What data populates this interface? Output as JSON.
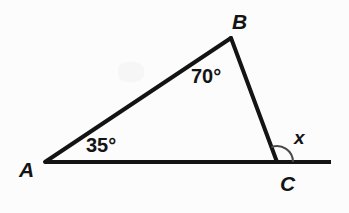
{
  "figure": {
    "background_color": "#fcfcfc",
    "stroke_color": "#141414",
    "arc_color": "#4a4a4a"
  },
  "vertices": {
    "A": {
      "label": "A",
      "x": 45,
      "y": 162
    },
    "B": {
      "label": "B",
      "x": 231,
      "y": 38
    },
    "C": {
      "label": "C",
      "x": 277,
      "y": 162
    }
  },
  "baseline": {
    "start_x": 45,
    "end_x": 331,
    "y": 162
  },
  "angles": {
    "at_A": {
      "label": "35°",
      "value": 35
    },
    "at_B": {
      "label": "70°",
      "value": 70
    },
    "exterior_at_C": {
      "label": "x",
      "value": null
    }
  },
  "arc": {
    "center_x": 277,
    "center_y": 162,
    "radius": 16
  }
}
